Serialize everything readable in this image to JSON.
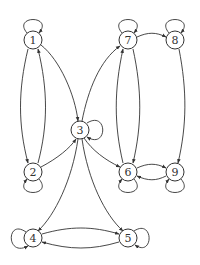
{
  "diagram": {
    "type": "directed-graph",
    "nodes": [
      {
        "id": "1",
        "label": "1",
        "x": 33,
        "y": 40
      },
      {
        "id": "2",
        "label": "2",
        "x": 33,
        "y": 172
      },
      {
        "id": "3",
        "label": "3",
        "x": 80,
        "y": 130
      },
      {
        "id": "4",
        "label": "4",
        "x": 33,
        "y": 238
      },
      {
        "id": "5",
        "label": "5",
        "x": 128,
        "y": 238
      },
      {
        "id": "6",
        "label": "6",
        "x": 128,
        "y": 172
      },
      {
        "id": "7",
        "label": "7",
        "x": 128,
        "y": 40
      },
      {
        "id": "8",
        "label": "8",
        "x": 175,
        "y": 40
      },
      {
        "id": "9",
        "label": "9",
        "x": 175,
        "y": 172
      }
    ],
    "edges": [
      {
        "from": "1",
        "to": "1",
        "kind": "self-loop"
      },
      {
        "from": "2",
        "to": "2",
        "kind": "self-loop"
      },
      {
        "from": "3",
        "to": "3",
        "kind": "self-loop"
      },
      {
        "from": "4",
        "to": "4",
        "kind": "self-loop"
      },
      {
        "from": "5",
        "to": "5",
        "kind": "self-loop"
      },
      {
        "from": "6",
        "to": "6",
        "kind": "self-loop"
      },
      {
        "from": "7",
        "to": "7",
        "kind": "self-loop"
      },
      {
        "from": "8",
        "to": "8",
        "kind": "self-loop"
      },
      {
        "from": "9",
        "to": "9",
        "kind": "self-loop"
      },
      {
        "from": "1",
        "to": "2"
      },
      {
        "from": "2",
        "to": "1"
      },
      {
        "from": "1",
        "to": "3"
      },
      {
        "from": "2",
        "to": "3"
      },
      {
        "from": "3",
        "to": "7"
      },
      {
        "from": "3",
        "to": "6"
      },
      {
        "from": "3",
        "to": "4"
      },
      {
        "from": "3",
        "to": "5"
      },
      {
        "from": "7",
        "to": "6"
      },
      {
        "from": "6",
        "to": "7"
      },
      {
        "from": "7",
        "to": "8"
      },
      {
        "from": "8",
        "to": "9"
      },
      {
        "from": "6",
        "to": "9"
      },
      {
        "from": "9",
        "to": "6"
      },
      {
        "from": "4",
        "to": "5"
      },
      {
        "from": "5",
        "to": "4"
      }
    ]
  }
}
